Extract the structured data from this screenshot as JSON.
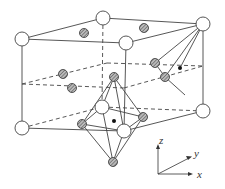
{
  "diagram": {
    "axes": {
      "z": "z",
      "y": "y",
      "x": "x"
    },
    "colors": {
      "line": "#444444",
      "open_atom_fill": "#ffffff",
      "hatched_atom_fill": "#9a9a9a",
      "dot": "#111111"
    },
    "open_atoms": [
      {
        "x": 22,
        "y": 39
      },
      {
        "x": 103,
        "y": 18
      },
      {
        "x": 203,
        "y": 24
      },
      {
        "x": 126,
        "y": 43
      },
      {
        "x": 22,
        "y": 128
      },
      {
        "x": 102,
        "y": 107
      },
      {
        "x": 203,
        "y": 111
      },
      {
        "x": 124,
        "y": 131
      }
    ],
    "hatched_atoms": [
      {
        "x": 84,
        "y": 33
      },
      {
        "x": 144,
        "y": 28
      },
      {
        "x": 63,
        "y": 74
      },
      {
        "x": 72,
        "y": 88
      },
      {
        "x": 114,
        "y": 77
      },
      {
        "x": 155,
        "y": 63
      },
      {
        "x": 165,
        "y": 77
      },
      {
        "x": 82,
        "y": 124
      },
      {
        "x": 143,
        "y": 117
      },
      {
        "x": 113,
        "y": 162
      }
    ],
    "black_dots": [
      {
        "x": 180,
        "y": 68
      },
      {
        "x": 114,
        "y": 121
      }
    ]
  }
}
